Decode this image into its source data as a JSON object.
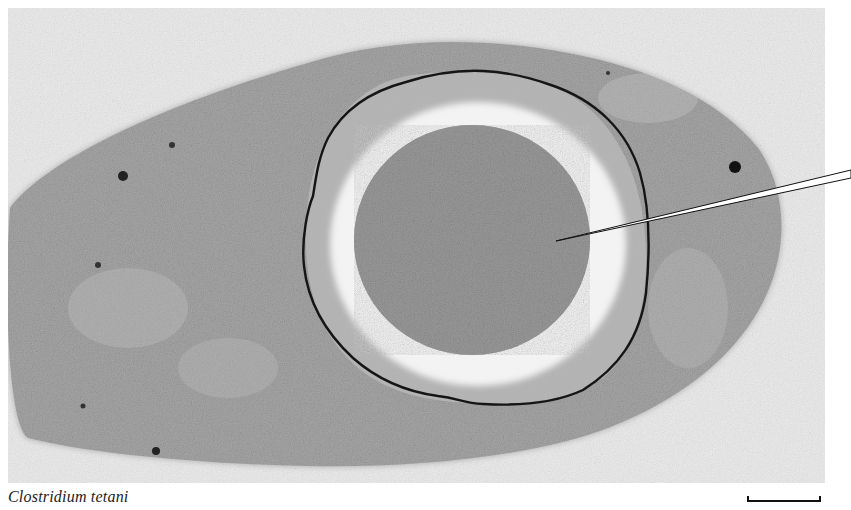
{
  "figure": {
    "caption": "Clostridium tetani",
    "scale_bar": {
      "label": ""
    },
    "colors": {
      "background": "#ececec",
      "cytoplasm": "#a9a9a9",
      "spore_core": "#9a9a9a",
      "spore_cortex": "#f2f2f2",
      "spore_coat": "#1a1a1a",
      "leader_line": "#111111"
    }
  }
}
